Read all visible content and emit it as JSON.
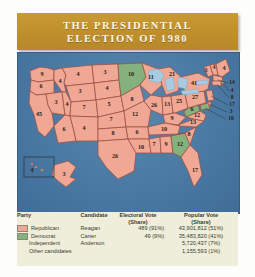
{
  "title": {
    "line1": "THE PRESIDENTIAL",
    "line2": "ELECTION OF 1980"
  },
  "colors": {
    "banner": "#c0912c",
    "republican": "#f0a894",
    "democrat": "#85b17e",
    "ocean": "#4a79a3",
    "legend_bg": "#efeedb",
    "state_border": "#9c4b3e"
  },
  "legend": {
    "headers": {
      "party": "Party",
      "candidate": "Candidate",
      "electoral_vote": "Electoral Vote",
      "electoral_share": "(Share)",
      "popular_vote": "Popular Vote",
      "popular_share": "(Share)"
    },
    "rows": [
      {
        "party": "Republican",
        "swatch": "republican",
        "candidate": "Reagan",
        "electoral": "489 (91%)",
        "popular": "43,901,812 (51%)"
      },
      {
        "party": "Democrat",
        "swatch": "democrat",
        "candidate": "Carter",
        "electoral": "49 (9%)",
        "popular": "35,483,820 (41%)"
      },
      {
        "party": "Independent",
        "swatch": "none",
        "candidate": "Anderson",
        "electoral": "",
        "popular": "5,720,437 (7%)"
      },
      {
        "party": "Other candidates",
        "swatch": "none",
        "candidate": "",
        "electoral": "",
        "popular": "1,155,593 (1%)"
      }
    ]
  },
  "map": {
    "states": [
      {
        "code": "WA",
        "votes": "9",
        "party": "republican"
      },
      {
        "code": "OR",
        "votes": "6",
        "party": "republican"
      },
      {
        "code": "CA",
        "votes": "45",
        "party": "republican"
      },
      {
        "code": "NV",
        "votes": "3",
        "party": "republican"
      },
      {
        "code": "ID",
        "votes": "4",
        "party": "republican"
      },
      {
        "code": "MT",
        "votes": "4",
        "party": "republican"
      },
      {
        "code": "WY",
        "votes": "3",
        "party": "republican"
      },
      {
        "code": "UT",
        "votes": "4",
        "party": "republican"
      },
      {
        "code": "AZ",
        "votes": "6",
        "party": "republican"
      },
      {
        "code": "CO",
        "votes": "7",
        "party": "republican"
      },
      {
        "code": "NM",
        "votes": "4",
        "party": "republican"
      },
      {
        "code": "ND",
        "votes": "3",
        "party": "republican"
      },
      {
        "code": "SD",
        "votes": "4",
        "party": "republican"
      },
      {
        "code": "NE",
        "votes": "5",
        "party": "republican"
      },
      {
        "code": "KS",
        "votes": "7",
        "party": "republican"
      },
      {
        "code": "OK",
        "votes": "8",
        "party": "republican"
      },
      {
        "code": "TX",
        "votes": "26",
        "party": "republican"
      },
      {
        "code": "MN",
        "votes": "10",
        "party": "democrat"
      },
      {
        "code": "IA",
        "votes": "8",
        "party": "republican"
      },
      {
        "code": "MO",
        "votes": "12",
        "party": "republican"
      },
      {
        "code": "AR",
        "votes": "6",
        "party": "republican"
      },
      {
        "code": "LA",
        "votes": "10",
        "party": "republican"
      },
      {
        "code": "WI",
        "votes": "11",
        "party": "republican"
      },
      {
        "code": "IL",
        "votes": "26",
        "party": "republican"
      },
      {
        "code": "MI",
        "votes": "21",
        "party": "republican"
      },
      {
        "code": "IN",
        "votes": "13",
        "party": "republican"
      },
      {
        "code": "OH",
        "votes": "25",
        "party": "republican"
      },
      {
        "code": "KY",
        "votes": "9",
        "party": "republican"
      },
      {
        "code": "TN",
        "votes": "10",
        "party": "republican"
      },
      {
        "code": "MS",
        "votes": "7",
        "party": "republican"
      },
      {
        "code": "AL",
        "votes": "9",
        "party": "republican"
      },
      {
        "code": "GA",
        "votes": "12",
        "party": "democrat"
      },
      {
        "code": "FL",
        "votes": "17",
        "party": "republican"
      },
      {
        "code": "SC",
        "votes": "8",
        "party": "republican"
      },
      {
        "code": "NC",
        "votes": "13",
        "party": "republican"
      },
      {
        "code": "VA",
        "votes": "12",
        "party": "republican"
      },
      {
        "code": "WV",
        "votes": "6",
        "party": "democrat"
      },
      {
        "code": "PA",
        "votes": "27",
        "party": "republican"
      },
      {
        "code": "NY",
        "votes": "41",
        "party": "republican"
      },
      {
        "code": "VT",
        "votes": "3",
        "party": "republican"
      },
      {
        "code": "NH",
        "votes": "4",
        "party": "republican"
      },
      {
        "code": "ME",
        "votes": "4",
        "party": "republican"
      },
      {
        "code": "MA",
        "votes": "14",
        "party": "republican"
      },
      {
        "code": "RI",
        "votes": "4",
        "party": "democrat"
      },
      {
        "code": "CT",
        "votes": "8",
        "party": "republican"
      },
      {
        "code": "NJ",
        "votes": "17",
        "party": "republican"
      },
      {
        "code": "DE",
        "votes": "3",
        "party": "republican"
      },
      {
        "code": "MD",
        "votes": "10",
        "party": "democrat"
      },
      {
        "code": "AK",
        "votes": "3",
        "party": "republican"
      },
      {
        "code": "HI",
        "votes": "4",
        "party": "democrat"
      }
    ]
  }
}
